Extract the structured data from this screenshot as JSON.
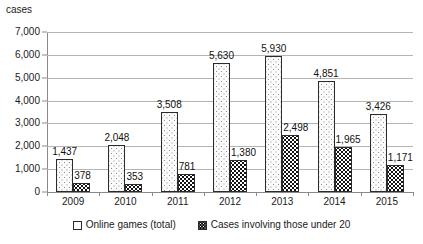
{
  "chart_data": {
    "type": "bar",
    "title": "",
    "xlabel": "",
    "ylabel": "cases",
    "ylim": [
      0,
      7000
    ],
    "ytick_step": 1000,
    "ytick_labels": [
      "0",
      "1,000",
      "2,000",
      "3,000",
      "4,000",
      "5,000",
      "6,000",
      "7,000"
    ],
    "ytick_values": [
      0,
      1000,
      2000,
      3000,
      4000,
      5000,
      6000,
      7000
    ],
    "grid": true,
    "legend_position": "bottom",
    "categories": [
      "2009",
      "2010",
      "2011",
      "2012",
      "2013",
      "2014",
      "2015"
    ],
    "series": [
      {
        "name": "Online games (total)",
        "pattern": "light-dotted",
        "values": [
          1437,
          2048,
          3508,
          5630,
          5930,
          4851,
          3426
        ],
        "labels": [
          "1,437",
          "2,048",
          "3,508",
          "5,630",
          "5,930",
          "4,851",
          "3,426"
        ]
      },
      {
        "name": "Cases involving those under 20",
        "pattern": "dark-checker",
        "values": [
          378,
          353,
          781,
          1380,
          2498,
          1965,
          1171
        ],
        "labels": [
          "378",
          "353",
          "781",
          "1,380",
          "2,498",
          "1,965",
          "1,171"
        ]
      }
    ]
  },
  "legend": {
    "items": [
      {
        "label": "Online games (total)",
        "swatch": "light-dotted-swatch"
      },
      {
        "label": "Cases involving those under 20",
        "swatch": "dark-checker-swatch"
      }
    ]
  },
  "axis": {
    "unit_label": "cases"
  },
  "colors": {
    "background": "#ffffff",
    "gridline": "#b4b4b4",
    "axis": "#8a8a8a",
    "bar_light_fill": "#fbfbfb",
    "bar_dark_fill": "#121212",
    "bar_border": "#2b2b2b",
    "text": "#1a1a1a"
  }
}
